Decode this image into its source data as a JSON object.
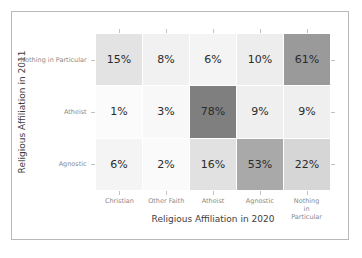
{
  "chart_data": {
    "type": "heatmap",
    "title": "",
    "xlabel": "Religious Affiliation in 2020",
    "ylabel": "Religious Affiliation in 2011",
    "x_categories": [
      "Christian",
      "Other Faith",
      "Atheist",
      "Agnostic",
      "Nothing\nin Particular"
    ],
    "y_categories": [
      "Nothing in Particular",
      "Atheist",
      "Agnostic"
    ],
    "value_suffix": "%",
    "vmin": 0,
    "vmax": 78,
    "colormap": "greys",
    "grid": false,
    "legend": "none",
    "rows": [
      {
        "label": "Nothing in Particular",
        "cells": [
          {
            "label": "15%",
            "value": 15,
            "color": "#e3e3e3"
          },
          {
            "label": "8%",
            "value": 8,
            "color": "#f1f1f1"
          },
          {
            "label": "6%",
            "value": 6,
            "color": "#f4f4f4"
          },
          {
            "label": "10%",
            "value": 10,
            "color": "#ededed"
          },
          {
            "label": "61%",
            "value": 61,
            "color": "#9a9a9a"
          }
        ]
      },
      {
        "label": "Atheist",
        "cells": [
          {
            "label": "1%",
            "value": 1,
            "color": "#fbfbfb"
          },
          {
            "label": "3%",
            "value": 3,
            "color": "#f8f8f8"
          },
          {
            "label": "78%",
            "value": 78,
            "color": "#7f7f7f"
          },
          {
            "label": "9%",
            "value": 9,
            "color": "#efefef"
          },
          {
            "label": "9%",
            "value": 9,
            "color": "#efefef"
          }
        ]
      },
      {
        "label": "Agnostic",
        "cells": [
          {
            "label": "6%",
            "value": 6,
            "color": "#f4f4f4"
          },
          {
            "label": "2%",
            "value": 2,
            "color": "#fafafa"
          },
          {
            "label": "16%",
            "value": 16,
            "color": "#e1e1e1"
          },
          {
            "label": "53%",
            "value": 53,
            "color": "#a9a9a9"
          },
          {
            "label": "22%",
            "value": 22,
            "color": "#d6d6d6"
          }
        ]
      }
    ]
  }
}
